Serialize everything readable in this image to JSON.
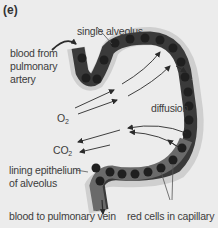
{
  "figure": {
    "panel_label": "(e)",
    "colors": {
      "background": "#ececec",
      "capillary_wall": "#3a3a3a",
      "red_cell": "#1f1f1f",
      "lining_epithelium": "#cfcfcf",
      "capillary_lower": "#6a6a6a",
      "text": "#3c3c3c",
      "arrow": "#2a2a2a"
    },
    "labels": {
      "single_alveolus": "single alveolus",
      "blood_from_line1": "blood from",
      "blood_from_line2": "pulmonary",
      "blood_from_line3": "artery",
      "o2_main": "O",
      "o2_sub": "2",
      "diffusion": "diffusion",
      "co2_main": "CO",
      "co2_sub": "2",
      "lining_line1": "lining epithelium",
      "lining_line2": "of alveolus",
      "blood_to": "blood to pulmonary vein",
      "red_cells": "red cells in capillary"
    }
  }
}
